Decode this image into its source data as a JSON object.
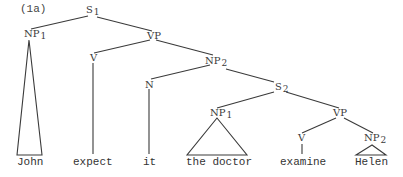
{
  "caption": "(1a)",
  "nodes": {
    "s1": {
      "label": "S",
      "sub": "1"
    },
    "np1_top": {
      "label": "NP",
      "sub": "1"
    },
    "vp_top": {
      "label": "VP",
      "sub": ""
    },
    "v_top": {
      "label": "V",
      "sub": ""
    },
    "np2_mid": {
      "label": "NP",
      "sub": "2"
    },
    "n": {
      "label": "N",
      "sub": ""
    },
    "s2": {
      "label": "S",
      "sub": "2"
    },
    "np1_low": {
      "label": "NP",
      "sub": "1"
    },
    "vp_low": {
      "label": "VP",
      "sub": ""
    },
    "v_low": {
      "label": "V",
      "sub": ""
    },
    "np2_low": {
      "label": "NP",
      "sub": "2"
    }
  },
  "leaves": {
    "john": "John",
    "expect": "expect",
    "it": "it",
    "the_doctor": "the doctor",
    "examine": "examine",
    "helen": "Helen"
  },
  "colors": {
    "line": "#3a3a3a",
    "text": "#333333",
    "background": "#ffffff"
  }
}
